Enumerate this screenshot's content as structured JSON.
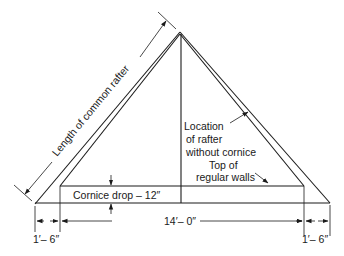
{
  "diagram": {
    "type": "roof-framing-section",
    "labels": {
      "rafter_length": "Length of common rafter",
      "location_line1": "Location",
      "location_line2": "of rafter",
      "location_line3": "without cornice",
      "walls_line1": "Top of",
      "walls_line2": "regular walls",
      "cornice_drop": "Cornice drop – 12″",
      "span": "14′– 0″",
      "left_overhang": "1′– 6″",
      "right_overhang": "1′– 6″"
    },
    "colors": {
      "line": "#1a1a1a",
      "background": "#ffffff"
    }
  }
}
